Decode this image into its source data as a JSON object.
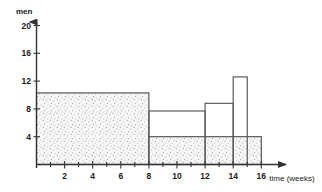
{
  "chart_data": {
    "type": "bar",
    "title": "",
    "subtitle": "",
    "ylabel": "men",
    "xlabel": "time (weeks)",
    "xlabel_unit_prefix": "16",
    "x": [
      0,
      2,
      4,
      6,
      8,
      10,
      12,
      14,
      16
    ],
    "xtick_labels": [
      "2",
      "4",
      "6",
      "8",
      "10",
      "12",
      "14",
      "16"
    ],
    "xtick_values": [
      2,
      4,
      6,
      8,
      10,
      12,
      14,
      16
    ],
    "ytick_labels": [
      "4",
      "8",
      "12",
      "16",
      "20"
    ],
    "ytick_values": [
      4,
      8,
      12,
      16,
      20
    ],
    "xlim": [
      0,
      16
    ],
    "ylim": [
      0,
      21
    ],
    "grid": false,
    "legend": "none",
    "series": [
      {
        "name": "planned manpower (shaded)",
        "style": "stippled",
        "steps": [
          {
            "x_start": 0,
            "x_end": 8,
            "value": 10.3
          },
          {
            "x_start": 8,
            "x_end": 16,
            "value": 4.0
          }
        ]
      },
      {
        "name": "actual manpower (outline)",
        "style": "outline",
        "steps": [
          {
            "x_start": 8,
            "x_end": 12,
            "value": 7.7
          },
          {
            "x_start": 12,
            "x_end": 14,
            "value": 8.8
          },
          {
            "x_start": 14,
            "x_end": 15,
            "value": 12.6
          }
        ]
      }
    ],
    "annotations": [],
    "colors": {
      "axis": "#333333",
      "outline": "#555555",
      "stipple_fill": "#f4f4f4",
      "stipple_dot": "#9a9a9a",
      "background": "#ffffff"
    }
  },
  "axes": {
    "y_axis_name": "men-axis",
    "x_axis_name": "time-axis",
    "y_arrow": "up-arrow-icon",
    "x_arrow": "right-arrow-icon"
  }
}
